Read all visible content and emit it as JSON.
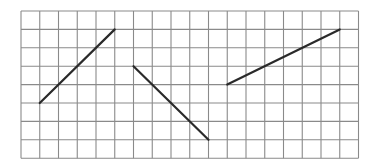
{
  "diagram": {
    "type": "grid-with-line-segments",
    "grid": {
      "columns": 18,
      "rows": 8,
      "origin_px": [
        21,
        11
      ],
      "cell_width_px": 18.75,
      "cell_height_px": 18.4,
      "line_color": "#8a8a8a",
      "background": "#ffffff"
    },
    "segments": [
      {
        "id": "segment-1",
        "from": [
          1,
          5
        ],
        "to": [
          5,
          1
        ],
        "color": "#2a2a2a"
      },
      {
        "id": "segment-2",
        "from": [
          6,
          3
        ],
        "to": [
          10,
          7
        ],
        "color": "#2a2a2a"
      },
      {
        "id": "segment-3",
        "from": [
          11,
          4
        ],
        "to": [
          17,
          1
        ],
        "color": "#2a2a2a"
      }
    ]
  }
}
